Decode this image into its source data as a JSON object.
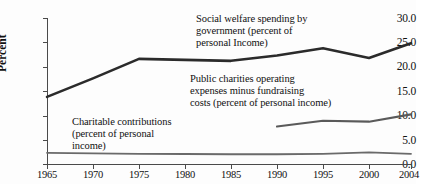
{
  "chart_data": {
    "type": "line",
    "title": "",
    "xlabel": "",
    "ylabel": "Percent",
    "xlim": [
      1965,
      2004
    ],
    "ylim": [
      0.0,
      30.0
    ],
    "grid": false,
    "legend_position": "inline-annotations",
    "y_ticks": [
      "30.0",
      "25.0",
      "20.0",
      "15.0",
      "10.0",
      "5.0",
      "0.0"
    ],
    "y_tick_values": [
      30.0,
      25.0,
      20.0,
      15.0,
      10.0,
      5.0,
      0.0
    ],
    "x_ticks": [
      "1965",
      "1970",
      "1975",
      "1980",
      "1985",
      "1990",
      "1995",
      "2000",
      "2004"
    ],
    "x_tick_values": [
      1965,
      1970,
      1975,
      1980,
      1985,
      1990,
      1995,
      2000,
      2004
    ],
    "series": [
      {
        "name": "Social welfare spending by government (percent of personal Income)",
        "color": "#2b2b2b",
        "width": 2.6,
        "x": [
          1965,
          1970,
          1975,
          1980,
          1985,
          1990,
          1995,
          2000,
          2004
        ],
        "values": [
          13.8,
          17.6,
          21.6,
          21.4,
          21.2,
          22.3,
          23.8,
          21.8,
          24.8
        ]
      },
      {
        "name": "Public charities operating expenses minus fundraising costs (percent of personal income)",
        "color": "#5a5a5a",
        "width": 2.1,
        "x": [
          1990,
          1995,
          2000,
          2004
        ],
        "values": [
          7.7,
          8.9,
          8.7,
          10.2
        ]
      },
      {
        "name": "Charitable contributions (percent of personal income)",
        "color": "#6a6a6a",
        "width": 1.8,
        "x": [
          1965,
          1970,
          1975,
          1980,
          1985,
          1990,
          1995,
          2000,
          2004
        ],
        "values": [
          2.3,
          2.2,
          2.1,
          2.05,
          2.0,
          2.0,
          2.1,
          2.4,
          2.1
        ]
      }
    ],
    "annotations": [
      {
        "id": "social-welfare",
        "text": "Social welfare spending by\ngovernment (percent of\npersonal Income)"
      },
      {
        "id": "public-charities",
        "text": "Public charities operating\nexpenses minus fundraising\ncosts (percent of personal income)"
      },
      {
        "id": "charitable-contributions",
        "text": "Charitable contributions\n(percent of personal\nincome)"
      }
    ]
  }
}
